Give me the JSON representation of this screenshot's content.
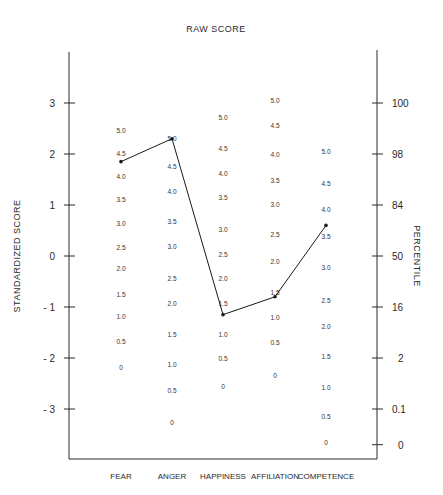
{
  "chart_data": {
    "type": "line",
    "title": "RAW SCORE",
    "xlabel": "",
    "ylabel": "STANDARDIZED SCORE",
    "y2label": "PERCENTILE",
    "categories": [
      "FEAR",
      "ANGER",
      "HAPPINESS",
      "AFFILIATION",
      "COMPETENCE"
    ],
    "ylim": [
      -3.6,
      3.8
    ],
    "grid": false,
    "legend": "none",
    "y_ticks": [
      {
        "value": 3,
        "label": "3"
      },
      {
        "value": 2,
        "label": "2"
      },
      {
        "value": 1,
        "label": "1"
      },
      {
        "value": 0,
        "label": "0"
      },
      {
        "value": -1,
        "label": "- 1"
      },
      {
        "value": -2,
        "label": "- 2"
      },
      {
        "value": -3,
        "label": "- 3"
      }
    ],
    "percentile_ticks": [
      {
        "z": 3,
        "label": "100"
      },
      {
        "z": 2,
        "label": "98"
      },
      {
        "z": 1,
        "label": "84"
      },
      {
        "z": 0,
        "label": "50"
      },
      {
        "z": -1,
        "label": "16"
      },
      {
        "z": -2,
        "label": "2"
      },
      {
        "z": -3,
        "label": "0.1"
      },
      {
        "z": -3.7,
        "label": "0"
      }
    ],
    "raw_score_scales": [
      {
        "category": "FEAR",
        "labels": [
          {
            "raw": "5.0",
            "z": 2.45
          },
          {
            "raw": "4.5",
            "z": 2.0
          },
          {
            "raw": "4.0",
            "z": 1.55
          },
          {
            "raw": "3.5",
            "z": 1.1
          },
          {
            "raw": "3.0",
            "z": 0.63
          },
          {
            "raw": "2.5",
            "z": 0.16
          },
          {
            "raw": "2.0",
            "z": -0.25
          },
          {
            "raw": "1.5",
            "z": -0.76
          },
          {
            "raw": "1.0",
            "z": -1.2
          },
          {
            "raw": "0.5",
            "z": -1.69
          },
          {
            "raw": "0",
            "z": -2.2
          }
        ]
      },
      {
        "category": "ANGER",
        "labels": [
          {
            "raw": "5.0",
            "z": 2.29
          },
          {
            "raw": "4.5",
            "z": 1.75
          },
          {
            "raw": "4.0",
            "z": 1.25
          },
          {
            "raw": "3.5",
            "z": 0.67
          },
          {
            "raw": "3.0",
            "z": 0.18
          },
          {
            "raw": "2.5",
            "z": -0.45
          },
          {
            "raw": "2.0",
            "z": -0.94
          },
          {
            "raw": "1.5",
            "z": -1.55
          },
          {
            "raw": "1.0",
            "z": -2.14
          },
          {
            "raw": "0.5",
            "z": -2.65
          },
          {
            "raw": "0",
            "z": -3.27
          }
        ]
      },
      {
        "category": "HAPPINESS",
        "labels": [
          {
            "raw": "5.0",
            "z": 2.71
          },
          {
            "raw": "4.5",
            "z": 2.1
          },
          {
            "raw": "4.0",
            "z": 1.61
          },
          {
            "raw": "3.5",
            "z": 1.14
          },
          {
            "raw": "3.0",
            "z": 0.51
          },
          {
            "raw": "2.5",
            "z": 0.02
          },
          {
            "raw": "2.0",
            "z": -0.45
          },
          {
            "raw": "1.5",
            "z": -0.94
          },
          {
            "raw": "1.0",
            "z": -1.55
          },
          {
            "raw": "0.5",
            "z": -2.02
          },
          {
            "raw": "0",
            "z": -2.57
          }
        ]
      },
      {
        "category": "AFFILIATION",
        "labels": [
          {
            "raw": "5.0",
            "z": 3.04
          },
          {
            "raw": "4.5",
            "z": 2.55
          },
          {
            "raw": "4.0",
            "z": 1.98
          },
          {
            "raw": "3.5",
            "z": 1.47
          },
          {
            "raw": "3.0",
            "z": 1.0
          },
          {
            "raw": "2.5",
            "z": 0.41
          },
          {
            "raw": "2.0",
            "z": -0.12
          },
          {
            "raw": "1.5",
            "z": -0.73
          },
          {
            "raw": "1.0",
            "z": -1.22
          },
          {
            "raw": "0.5",
            "z": -1.71
          },
          {
            "raw": "0",
            "z": -2.35
          }
        ]
      },
      {
        "category": "COMPETENCE",
        "labels": [
          {
            "raw": "5.0",
            "z": 2.04
          },
          {
            "raw": "4.5",
            "z": 1.41
          },
          {
            "raw": "4.0",
            "z": 0.9
          },
          {
            "raw": "3.5",
            "z": 0.37
          },
          {
            "raw": "3.0",
            "z": -0.24
          },
          {
            "raw": "2.5",
            "z": -0.88
          },
          {
            "raw": "2.0",
            "z": -1.39
          },
          {
            "raw": "1.5",
            "z": -1.98
          },
          {
            "raw": "1.0",
            "z": -2.59
          },
          {
            "raw": "0.5",
            "z": -3.16
          },
          {
            "raw": "0",
            "z": -3.67
          }
        ]
      }
    ],
    "series": [
      {
        "name": "Profile",
        "raw_values": [
          4.4,
          4.95,
          1.3,
          1.4,
          3.7
        ],
        "values": [
          1.85,
          2.3,
          -1.15,
          -0.8,
          0.6
        ]
      }
    ]
  }
}
